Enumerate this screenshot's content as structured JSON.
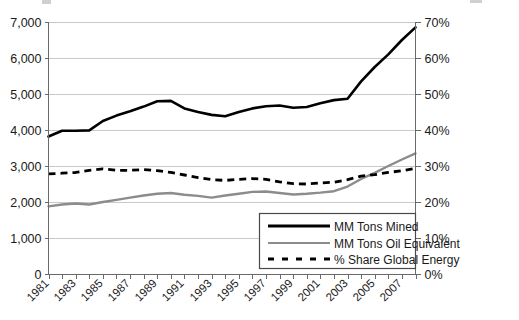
{
  "chart_data": {
    "type": "line",
    "title": "",
    "subtitle": "",
    "xlabel": "",
    "ylabel": "",
    "y2label": "",
    "grid": true,
    "legend_position": "bottom-right",
    "x": [
      1981,
      1982,
      1983,
      1984,
      1985,
      1986,
      1987,
      1988,
      1989,
      1990,
      1991,
      1992,
      1993,
      1994,
      1995,
      1996,
      1997,
      1998,
      1999,
      2000,
      2001,
      2002,
      2003,
      2004,
      2005,
      2006,
      2007,
      2008
    ],
    "categories": [
      "1981",
      "1982",
      "1983",
      "1984",
      "1985",
      "1986",
      "1987",
      "1988",
      "1989",
      "1990",
      "1991",
      "1992",
      "1993",
      "1994",
      "1995",
      "1996",
      "1997",
      "1998",
      "1999",
      "2000",
      "2001",
      "2002",
      "2003",
      "2004",
      "2005",
      "2006",
      "2007",
      "2008"
    ],
    "xtick_labels": [
      "1981",
      "1983",
      "1985",
      "1987",
      "1989",
      "1991",
      "1993",
      "1995",
      "1997",
      "1999",
      "2001",
      "2003",
      "2005",
      "2007"
    ],
    "xlim": [
      1981,
      2008
    ],
    "ylim": [
      0,
      7000
    ],
    "ytick_labels": [
      "0",
      "1,000",
      "2,000",
      "3,000",
      "4,000",
      "5,000",
      "6,000",
      "7,000"
    ],
    "ytick_values": [
      0,
      1000,
      2000,
      3000,
      4000,
      5000,
      6000,
      7000
    ],
    "y2lim": [
      0,
      70
    ],
    "y2tick_labels": [
      "0%",
      "10%",
      "20%",
      "30%",
      "40%",
      "50%",
      "60%",
      "70%"
    ],
    "y2tick_values": [
      0,
      10,
      20,
      30,
      40,
      50,
      60,
      70
    ],
    "series": [
      {
        "name": "MM Tons Mined",
        "axis": "left",
        "style": "solid",
        "color": "#000000",
        "width": 2.6,
        "values": [
          3820,
          3980,
          3980,
          3990,
          4250,
          4400,
          4520,
          4650,
          4800,
          4810,
          4600,
          4500,
          4420,
          4380,
          4500,
          4600,
          4660,
          4680,
          4620,
          4640,
          4740,
          4830,
          4870,
          5350,
          5750,
          6100,
          6500,
          6850
        ]
      },
      {
        "name": "MM Tons Oil Equivalent",
        "axis": "left",
        "style": "solid",
        "color": "#8c8c8c",
        "width": 2.4,
        "values": [
          1880,
          1930,
          1960,
          1930,
          2000,
          2060,
          2120,
          2180,
          2230,
          2250,
          2200,
          2170,
          2120,
          2180,
          2230,
          2280,
          2290,
          2250,
          2210,
          2230,
          2260,
          2300,
          2430,
          2640,
          2810,
          3000,
          3180,
          3350
        ]
      },
      {
        "name": "% Share Global Energy",
        "axis": "right",
        "style": "dashed",
        "color": "#000000",
        "width": 2.8,
        "values": [
          27.8,
          28.0,
          28.2,
          28.8,
          29.2,
          28.8,
          28.8,
          29.0,
          28.7,
          28.2,
          27.5,
          26.8,
          26.2,
          26.0,
          26.3,
          26.5,
          26.3,
          25.6,
          25.1,
          25.0,
          25.3,
          25.5,
          26.2,
          27.2,
          27.6,
          28.2,
          28.7,
          29.3
        ]
      }
    ],
    "legend": [
      {
        "label": "MM Tons Mined",
        "style": "solid",
        "color": "#000000"
      },
      {
        "label": "MM Tons Oil Equivalent",
        "style": "solid",
        "color": "#8c8c8c"
      },
      {
        "label": "% Share Global Energy",
        "style": "dashed",
        "color": "#000000"
      }
    ]
  }
}
